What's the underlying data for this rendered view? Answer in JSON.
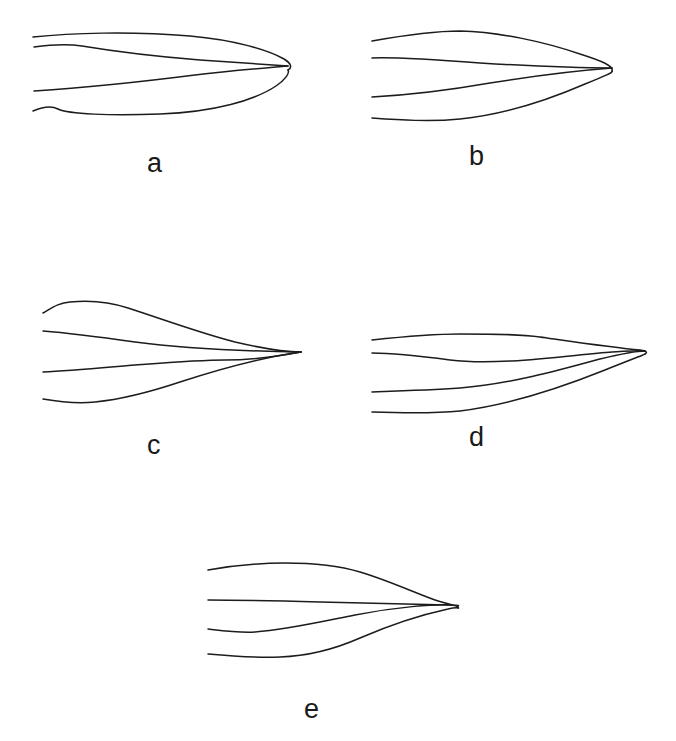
{
  "figure": {
    "type": "line-drawing-plate",
    "background_color": "#ffffff",
    "stroke_color": "#1c1c1c",
    "stroke_width": 1.5,
    "canvas": {
      "width": 676,
      "height": 741
    },
    "panel_count": 5,
    "panels": [
      {
        "id": "a",
        "label": "a",
        "label_x": 147,
        "label_y": 150,
        "apex": {
          "x": 289,
          "y": 65
        },
        "base_x": 33,
        "curve_count": 4,
        "apex_shape": "rounded",
        "paths": [
          "M33,37 C70,33 130,31 190,36 C235,40 268,50 284,59 C292,64 292,68 288,70",
          "M34,47 C55,44 70,44 82,46 C100,49 150,56 200,60 C240,63 272,65 288,66",
          "M34,91 C80,88 140,82 195,75 C235,70 268,68 288,66",
          "M33,111 C45,106 52,106 58,109 C68,114 110,116 160,114 C215,112 255,100 276,86 C285,80 290,73 288,70"
        ]
      },
      {
        "id": "b",
        "label": "b",
        "label_x": 469,
        "label_y": 143,
        "apex": {
          "x": 616,
          "y": 67
        },
        "base_x": 372,
        "curve_count": 4,
        "apex_shape": "rounded",
        "paths": [
          "M372,41 C400,36 430,31 460,31 C500,32 545,42 580,54 C602,61 614,66 612,71",
          "M372,58 C400,57 440,60 480,63 C530,66 580,68 612,68",
          "M372,97 C410,95 450,90 490,83 C540,75 585,70 612,68",
          "M372,118 C400,120 430,122 460,119 C510,114 555,97 585,84 C605,76 614,72 612,71"
        ]
      },
      {
        "id": "c",
        "label": "c",
        "label_x": 147,
        "label_y": 432,
        "apex": {
          "x": 301,
          "y": 352
        },
        "base_x": 43,
        "curve_count": 4,
        "apex_shape": "sharp-point",
        "paths": [
          "M43,313 C52,308 58,303 70,302 C90,300 110,302 128,308 C165,320 200,333 235,342 C265,349 290,352 301,352",
          "M43,331 C70,333 100,337 135,342 C180,348 240,351 301,352",
          "M43,372 C70,371 100,368 135,365 C175,362 200,360 225,360 C255,360 285,355 301,352",
          "M43,399 C60,402 75,404 95,402 C125,399 150,392 180,382 C220,369 265,357 301,352"
        ]
      },
      {
        "id": "d",
        "label": "d",
        "label_x": 469,
        "label_y": 424,
        "apex": {
          "x": 646,
          "y": 350
        },
        "base_x": 372,
        "curve_count": 4,
        "apex_shape": "rounded-narrow",
        "paths": [
          "M372,340 C400,337 430,334 460,334 C495,334 520,334 540,337 C575,342 615,348 640,350 C646,351 648,352 645,354",
          "M372,353 C395,353 420,356 450,360 C500,366 570,355 612,352 C630,351 640,350 645,351",
          "M372,392 C400,391 430,390 460,388 C510,384 560,370 600,359 C625,353 640,351 645,351",
          "M372,412 C400,413 430,414 460,411 C510,405 560,388 605,370 C630,360 646,354 645,354"
        ]
      },
      {
        "id": "e",
        "label": "e",
        "label_x": 304,
        "label_y": 696,
        "apex": {
          "x": 460,
          "y": 605
        },
        "base_x": 208,
        "curve_count": 4,
        "apex_shape": "elongated-open-loop",
        "paths": [
          "M208,570 C230,566 255,563 285,563 C315,563 340,566 360,572 C390,581 415,593 435,600 C450,605 460,606 458,608",
          "M208,600 C240,600 280,601 320,602 C370,603 420,604 448,605 C455,605 460,605 458,606",
          "M208,629 C225,631 240,633 255,632 C285,630 320,622 355,615 C395,607 435,604 452,605",
          "M208,654 C230,656 255,658 280,657 C310,656 335,649 360,638 C390,625 425,614 448,609 C456,607 460,608 458,608"
        ]
      }
    ]
  }
}
